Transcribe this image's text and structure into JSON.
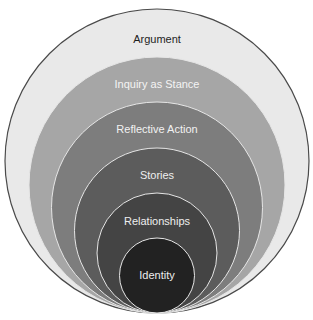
{
  "diagram": {
    "type": "nested-circles",
    "center_x": 157,
    "bottom_y": 313,
    "outer_border_color": "#4a4a4a",
    "separator_color": "#e6e6e6",
    "layers": [
      {
        "label": "Argument",
        "top_y": 9,
        "fill": "#e9e9e9",
        "text_color": "#1e1e1e",
        "label_y": 40
      },
      {
        "label": "Inquiry as Stance",
        "top_y": 57,
        "fill": "#a6a6a6",
        "text_color": "#f4f4f4",
        "label_y": 85
      },
      {
        "label": "Reflective Action",
        "top_y": 102,
        "fill": "#7d7d7d",
        "text_color": "#f2f2f2",
        "label_y": 130
      },
      {
        "label": "Stories",
        "top_y": 148,
        "fill": "#5c5c5c",
        "text_color": "#eeeeee",
        "label_y": 176
      },
      {
        "label": "Relationships",
        "top_y": 193,
        "fill": "#444444",
        "text_color": "#eeeeee",
        "label_y": 222
      },
      {
        "label": "Identity",
        "top_y": 238,
        "fill": "#222222",
        "text_color": "#eeeeee",
        "label_y": 276
      }
    ]
  }
}
